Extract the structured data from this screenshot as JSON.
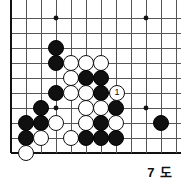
{
  "diagram": {
    "caption": "7 도",
    "kind": "go-board-diagram",
    "colors": {
      "background": "#ffffff",
      "grid_line": "#555555",
      "border_line": "#111111",
      "black_stone": "#101010",
      "white_stone": "#ffffff",
      "stone_outline": "#101010"
    },
    "geometry": {
      "origin_x": 11,
      "origin_y": 18,
      "spacing": 15,
      "cols": 12,
      "rows": 10,
      "stone_radius": 8.2
    },
    "star_points": [
      {
        "x": 56,
        "y": 18
      },
      {
        "x": 146,
        "y": 18
      },
      {
        "x": 56,
        "y": 108
      },
      {
        "x": 146,
        "y": 108
      }
    ],
    "stones": [
      {
        "color": "black",
        "x": 56,
        "y": 48,
        "label": ""
      },
      {
        "color": "black",
        "x": 56,
        "y": 63,
        "label": ""
      },
      {
        "color": "white",
        "x": 71,
        "y": 63,
        "label": ""
      },
      {
        "color": "white",
        "x": 86,
        "y": 63,
        "label": ""
      },
      {
        "color": "white",
        "x": 101,
        "y": 63,
        "label": ""
      },
      {
        "color": "white",
        "x": 71,
        "y": 78,
        "label": ""
      },
      {
        "color": "black",
        "x": 86,
        "y": 78,
        "label": ""
      },
      {
        "color": "black",
        "x": 101,
        "y": 78,
        "label": ""
      },
      {
        "color": "black",
        "x": 56,
        "y": 93,
        "label": ""
      },
      {
        "color": "white",
        "x": 71,
        "y": 93,
        "label": ""
      },
      {
        "color": "white",
        "x": 86,
        "y": 93,
        "label": ""
      },
      {
        "color": "black",
        "x": 101,
        "y": 93,
        "label": ""
      },
      {
        "color": "white",
        "x": 117,
        "y": 93,
        "label": "1"
      },
      {
        "color": "black",
        "x": 41,
        "y": 108,
        "label": ""
      },
      {
        "color": "white",
        "x": 86,
        "y": 108,
        "label": ""
      },
      {
        "color": "white",
        "x": 101,
        "y": 108,
        "label": ""
      },
      {
        "color": "black",
        "x": 116,
        "y": 108,
        "label": ""
      },
      {
        "color": "black",
        "x": 26,
        "y": 123,
        "label": ""
      },
      {
        "color": "black",
        "x": 41,
        "y": 123,
        "label": ""
      },
      {
        "color": "white",
        "x": 56,
        "y": 123,
        "label": ""
      },
      {
        "color": "white",
        "x": 86,
        "y": 123,
        "label": ""
      },
      {
        "color": "black",
        "x": 101,
        "y": 123,
        "label": ""
      },
      {
        "color": "white",
        "x": 116,
        "y": 123,
        "label": ""
      },
      {
        "color": "black",
        "x": 161,
        "y": 123,
        "label": ""
      },
      {
        "color": "black",
        "x": 26,
        "y": 138,
        "label": ""
      },
      {
        "color": "white",
        "x": 41,
        "y": 138,
        "label": ""
      },
      {
        "color": "white",
        "x": 71,
        "y": 138,
        "label": ""
      },
      {
        "color": "black",
        "x": 86,
        "y": 138,
        "label": ""
      },
      {
        "color": "black",
        "x": 101,
        "y": 138,
        "label": ""
      },
      {
        "color": "black",
        "x": 116,
        "y": 138,
        "label": ""
      },
      {
        "color": "white",
        "x": 26,
        "y": 153,
        "label": ""
      }
    ]
  }
}
